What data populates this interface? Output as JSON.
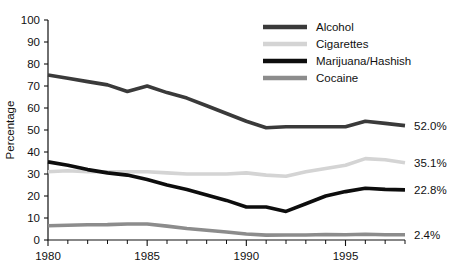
{
  "chart_data": {
    "type": "line",
    "title": "",
    "xlabel": "",
    "ylabel": "Percentage",
    "xlim": [
      1980,
      1998
    ],
    "ylim": [
      0,
      100
    ],
    "grid": false,
    "legend_position": "top-right",
    "x": [
      1980,
      1981,
      1982,
      1983,
      1984,
      1985,
      1986,
      1987,
      1988,
      1989,
      1990,
      1991,
      1992,
      1993,
      1994,
      1995,
      1996,
      1997,
      1998
    ],
    "xticks": [
      1980,
      1985,
      1990,
      1995
    ],
    "xtick_labels": [
      "1980",
      "1985",
      "1990",
      "1995"
    ],
    "yticks": [
      0,
      10,
      20,
      30,
      40,
      50,
      60,
      70,
      80,
      90,
      100
    ],
    "ytick_labels": [
      "0",
      "10",
      "20",
      "30",
      "40",
      "50",
      "60",
      "70",
      "80",
      "90",
      "100"
    ],
    "series": [
      {
        "name": "Alcohol",
        "color": "#3a3a3a",
        "width": 3.6,
        "end_label": "52.0%",
        "values": [
          75.0,
          73.5,
          72.0,
          70.5,
          67.5,
          70.0,
          67.0,
          64.5,
          61.0,
          57.5,
          54.0,
          51.0,
          51.5,
          51.5,
          51.5,
          51.5,
          54.0,
          53.0,
          52.0
        ]
      },
      {
        "name": "Cigarettes",
        "color": "#d4d4d4",
        "width": 3.6,
        "end_label": "35.1%",
        "values": [
          31.0,
          31.5,
          31.0,
          31.0,
          31.0,
          31.0,
          30.5,
          30.0,
          30.0,
          30.0,
          30.5,
          29.5,
          29.0,
          31.0,
          32.5,
          34.0,
          37.0,
          36.5,
          35.1
        ]
      },
      {
        "name": "Marijuana/Hashish",
        "color": "#0d0d0d",
        "width": 3.6,
        "end_label": "22.8%",
        "values": [
          35.5,
          34.0,
          32.0,
          30.5,
          29.5,
          27.5,
          25.0,
          23.0,
          20.5,
          18.0,
          15.0,
          15.0,
          13.0,
          16.5,
          20.0,
          22.0,
          23.5,
          23.0,
          22.8
        ]
      },
      {
        "name": "Cocaine",
        "color": "#8c8c8c",
        "width": 3.6,
        "end_label": "2.4%",
        "values": [
          6.5,
          6.7,
          6.9,
          7.0,
          7.3,
          7.3,
          6.3,
          5.2,
          4.4,
          3.6,
          2.7,
          2.2,
          2.3,
          2.3,
          2.5,
          2.4,
          2.6,
          2.4,
          2.4
        ]
      }
    ]
  }
}
